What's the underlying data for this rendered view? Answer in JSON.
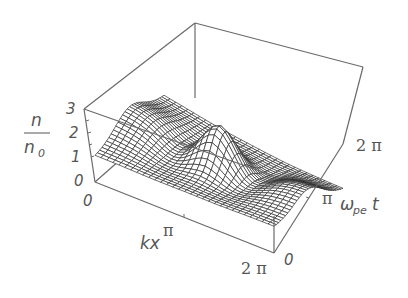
{
  "chart_data": {
    "type": "surface3d",
    "title": "",
    "zlabel": {
      "numerator": "n",
      "denominator": "n",
      "denominator_sub": "0"
    },
    "xlabel": "kx",
    "ylabel": {
      "base": "ω",
      "sub": "pe",
      "tail": "t"
    },
    "z_ticks": [
      "0",
      "1",
      "2",
      "3"
    ],
    "x_ticks": [
      "0",
      "π",
      "2 π"
    ],
    "y_ticks": [
      "0",
      "π",
      "2 π"
    ],
    "x_range": [
      0,
      6.2832
    ],
    "y_range": [
      0,
      6.2832
    ],
    "z_range": [
      0,
      3
    ],
    "grid_lines": 30,
    "peak": {
      "kx": 3.1416,
      "omega_pe_t": 3.1416,
      "n_over_n0": 3.0
    }
  },
  "colors": {
    "mesh_line": "#2e2e2e",
    "box_line": "#6a6a6a",
    "label": "#555555",
    "background": "#ffffff"
  }
}
